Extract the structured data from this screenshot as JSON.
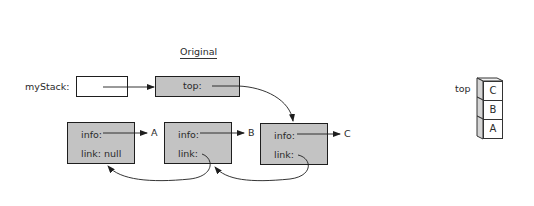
{
  "title": "Original",
  "reference_label": "myStack:",
  "stack_node": {
    "field": "top:"
  },
  "nodes": [
    {
      "info_label": "info:",
      "link_label": "link: null",
      "value": "A"
    },
    {
      "info_label": "info:",
      "link_label": "link:",
      "value": "B"
    },
    {
      "info_label": "info:",
      "link_label": "link:",
      "value": "C"
    }
  ],
  "stack_picture": {
    "top_label": "top",
    "items": [
      "C",
      "B",
      "A"
    ]
  },
  "colors": {
    "node_fill": "#c3c3c3",
    "stroke": "#1e1e1e"
  }
}
